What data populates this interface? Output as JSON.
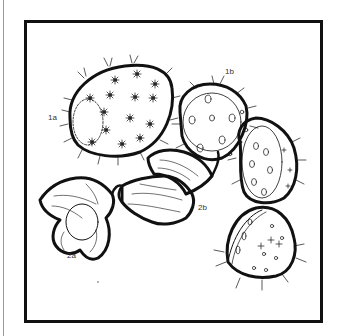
{
  "illustration": {
    "subject": "fruit line drawing: horned melon (kiwano) and cape gooseberry (physalis)",
    "labels": [
      {
        "id": "1a",
        "text": "1a",
        "x": 48,
        "y": 113
      },
      {
        "id": "1b",
        "text": "1b",
        "x": 225,
        "y": 67
      },
      {
        "id": "2a",
        "text": "2a",
        "x": 67,
        "y": 251
      },
      {
        "id": "2b",
        "text": "2b",
        "x": 198,
        "y": 203
      }
    ],
    "colors": {
      "ink": "#111111",
      "paper": "#ffffff",
      "edge": "#9a9a9a"
    }
  }
}
